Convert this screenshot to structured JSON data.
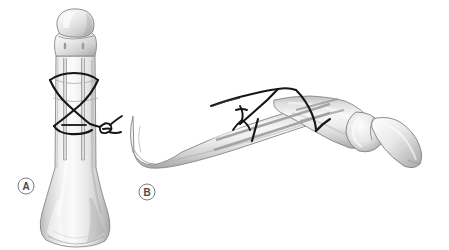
{
  "figure": {
    "background_color": "#ffffff",
    "width": 449,
    "height": 250,
    "border_color": "#f2f2f2"
  },
  "panels": [
    {
      "id": "panel-a",
      "label": "A",
      "view": "dorsal anteroposterior view",
      "label_position": {
        "cx": 26,
        "cy": 186,
        "r": 8
      },
      "label_circle_color": "#7d7d7d",
      "label_text_color": "#4a4a4a",
      "description": "Phalanx seen from the front with two parallel K-wires driven longitudinally through the fracture and a figure-of-eight tension band wire looped around the wire ends and through a transverse drill hole."
    },
    {
      "id": "panel-b",
      "label": "B",
      "view": "lateral side view",
      "label_position": {
        "cx": 147,
        "cy": 192,
        "r": 8
      },
      "label_circle_color": "#7d7d7d",
      "label_text_color": "#4a4a4a",
      "description": "The same phalanx seen from the side showing the dorsal course of the tension band wire over the fracture site, the twisted wire knot and the distal interphalangeal joint with the distal phalanx."
    }
  ],
  "colors": {
    "bone_fill_light": "#f4f4f4",
    "bone_fill_mid": "#dcdcdc",
    "bone_fill_shadow": "#b8b8b8",
    "bone_outline": "#8a8a8a",
    "bone_outline_dark": "#6f6f6f",
    "wire_black": "#1a1a1a",
    "kwire_gray": "#9a9a9a",
    "highlight_white": "#ffffff",
    "label_stroke": "#7d7d7d",
    "label_text": "#4a4a4a"
  },
  "elements": {
    "kwire_count": 2,
    "tension_band_shape": "figure-of-eight",
    "wire_knot": "twisted loop knot",
    "bone_name": "proximal phalanx",
    "distal_bone_name": "distal phalanx"
  }
}
